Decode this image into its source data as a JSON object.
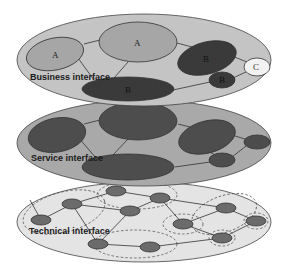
{
  "diagram": {
    "colors": {
      "background": "#ffffff",
      "business_layer_fill": "#c4c4c4",
      "service_layer_fill": "#a9a9a9",
      "technical_layer_fill": "#e4e4e4",
      "light_node_fill": "#a6a6a6",
      "dark_node_fill": "#3a3a3a",
      "service_node_fill": "#4d4d4d",
      "tech_node_fill": "#6b6b6b",
      "white_node_fill": "#f2f2f2",
      "stroke": "#333333",
      "dashed_stroke": "#555555"
    },
    "layers": [
      {
        "id": "business",
        "label": "Business interface",
        "nodes": [
          {
            "id": "a-left",
            "label": "A",
            "style": "light"
          },
          {
            "id": "a-top",
            "label": "A",
            "style": "light"
          },
          {
            "id": "b-right",
            "label": "B",
            "style": "dark"
          },
          {
            "id": "c-right",
            "label": "C",
            "style": "white"
          },
          {
            "id": "b-small",
            "label": "B",
            "style": "dark"
          },
          {
            "id": "b-bottom",
            "label": "B",
            "style": "dark"
          }
        ]
      },
      {
        "id": "service",
        "label": "Service interface",
        "nodes": [
          {
            "id": "s-left",
            "label": ""
          },
          {
            "id": "s-top",
            "label": ""
          },
          {
            "id": "s-right",
            "label": ""
          },
          {
            "id": "s-far-right",
            "label": ""
          },
          {
            "id": "s-small",
            "label": ""
          },
          {
            "id": "s-bottom",
            "label": ""
          }
        ]
      },
      {
        "id": "technical",
        "label": "Technical interface",
        "node_count": 10,
        "cluster_count": 5
      }
    ]
  }
}
